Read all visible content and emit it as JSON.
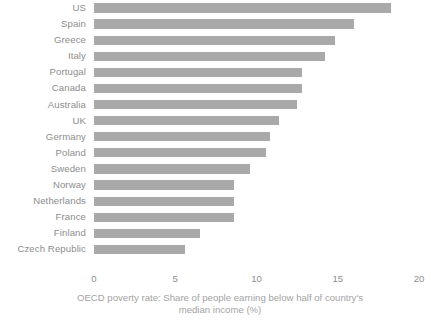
{
  "chart_data": {
    "type": "bar",
    "orientation": "horizontal",
    "title": "",
    "subtitle": "",
    "xlabel": "OECD poverty rate: Share of people earning below half of country's median income (%)",
    "ylabel": "",
    "categories": [
      "US",
      "Spain",
      "Greece",
      "Italy",
      "Portugal",
      "Canada",
      "Australia",
      "UK",
      "Germany",
      "Poland",
      "Sweden",
      "Norway",
      "Netherlands",
      "France",
      "Finland",
      "Czech Republic"
    ],
    "values": [
      18.3,
      16.0,
      14.8,
      14.2,
      12.8,
      12.8,
      12.5,
      11.4,
      10.8,
      10.6,
      9.6,
      8.6,
      8.6,
      8.6,
      6.5,
      5.6
    ],
    "xlim": [
      0,
      20
    ],
    "xticks": [
      0,
      5,
      10,
      15,
      20
    ],
    "xtick_labels": [
      "0",
      "5",
      "10",
      "15",
      "20"
    ],
    "grid": false,
    "legend": false,
    "bar_color": "#a9a9a9",
    "text_color": "#8d8d8d",
    "axis_title_color": "#a3a3a3",
    "background": "#ffffff"
  }
}
